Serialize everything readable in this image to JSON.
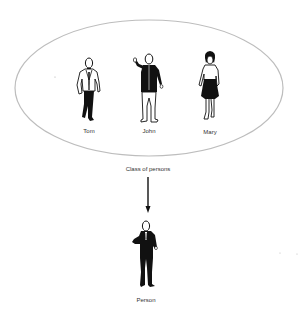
{
  "diagram": {
    "type": "class-instance-abstraction",
    "class_container": {
      "shape": "ellipse",
      "label": "Class of persons",
      "stroke_color": "#bdbdbd"
    },
    "members": [
      {
        "name": "Tom",
        "figure": "man-in-jacket-icon"
      },
      {
        "name": "John",
        "figure": "man-waving-icon"
      },
      {
        "name": "Mary",
        "figure": "woman-in-skirt-icon"
      }
    ],
    "arrow": {
      "direction": "down",
      "from": "Class of persons",
      "to": "Person",
      "color": "#111111"
    },
    "result": {
      "name": "Person",
      "figure": "man-in-suit-icon"
    }
  }
}
